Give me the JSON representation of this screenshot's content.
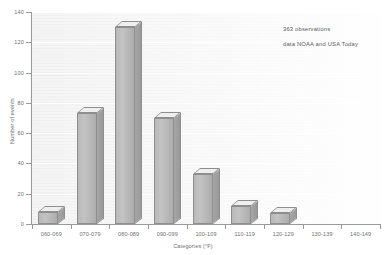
{
  "chart_data": {
    "type": "bar",
    "title": "",
    "subtitle": "",
    "xlabel": "Categories (°F)",
    "ylabel": "Number of events",
    "categories": [
      "060-069",
      "070-079",
      "080-089",
      "090-099",
      "100-109",
      "110-119",
      "120-129",
      "130-139",
      "140-149"
    ],
    "values": [
      8,
      73,
      130,
      70,
      33,
      12,
      7,
      0,
      0
    ],
    "ylim": [
      0,
      140
    ],
    "ytick_values": [
      0,
      20,
      40,
      60,
      80,
      100,
      120,
      140
    ],
    "ytick_labels": [
      "0",
      "20",
      "40",
      "60",
      "80",
      "100",
      "120",
      "140"
    ],
    "grid": true,
    "legend": "none",
    "style": "3d-columns",
    "annotations": [
      "363 observations",
      "data NOAA and USA Today"
    ],
    "colors": {
      "bar_front": "#bdbdbd",
      "bar_side": "#a0a0a0",
      "bar_top": "#efefef",
      "bar_edge": "#8e8e8e",
      "plot_background": "#f1f1f1",
      "gridline": "#ffffff",
      "axis": "#9a9a9a",
      "text": "#6e6e6e",
      "page_background": "#ffffff"
    }
  }
}
